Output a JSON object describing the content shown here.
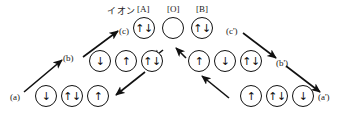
{
  "figure": {
    "title_label": "イオン",
    "column_headers": [
      "[A]",
      "[O]",
      "[B]"
    ],
    "stage_labels": {
      "a": "(a)",
      "b": "(b)",
      "c": "(c)",
      "c_prime": "(c')",
      "b_prime": "(b')",
      "a_prime": "(a')"
    }
  },
  "rows": {
    "top": {
      "name": "top-row",
      "sites": [
        {
          "site": "A",
          "spins": "↑↓"
        },
        {
          "site": "O",
          "spins": ""
        },
        {
          "site": "B",
          "spins": "↑↓"
        }
      ]
    },
    "middle_left": {
      "name": "middle-left-row",
      "sites": [
        {
          "site": "A",
          "spins": "↓"
        },
        {
          "site": "O",
          "spins": "↑"
        },
        {
          "site": "B",
          "spins": "↑↓"
        }
      ]
    },
    "middle_right": {
      "name": "middle-right-row",
      "sites": [
        {
          "site": "A",
          "spins": "↑"
        },
        {
          "site": "O",
          "spins": "↓"
        },
        {
          "site": "B",
          "spins": "↑↓"
        }
      ]
    },
    "bottom_left": {
      "name": "bottom-left-row",
      "sites": [
        {
          "site": "A",
          "spins": "↓"
        },
        {
          "site": "O",
          "spins": "↑↓"
        },
        {
          "site": "B",
          "spins": "↑"
        }
      ]
    },
    "bottom_right": {
      "name": "bottom-right-row",
      "sites": [
        {
          "site": "A",
          "spins": "↑"
        },
        {
          "site": "O",
          "spins": "↑↓"
        },
        {
          "site": "B",
          "spins": "↓"
        }
      ]
    }
  },
  "colors": {
    "ink": "#111111",
    "background": "#ffffff"
  }
}
